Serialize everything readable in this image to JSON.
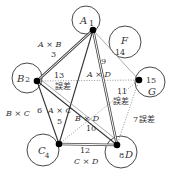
{
  "diagram": {
    "type": "factor-interaction-graph",
    "nodes": [
      {
        "id": "A",
        "letter": "A",
        "number": "1"
      },
      {
        "id": "B",
        "letter": "B",
        "number": "2"
      },
      {
        "id": "C",
        "letter": "C",
        "number": "4"
      },
      {
        "id": "D",
        "letter": "D",
        "number": "8"
      },
      {
        "id": "F",
        "letter": "F",
        "number": "14"
      },
      {
        "id": "G",
        "letter": "G",
        "number": "15"
      }
    ],
    "edges": [
      {
        "from": "A",
        "to": "B",
        "label": "A × B",
        "number": "3",
        "style": "double"
      },
      {
        "from": "B",
        "to": "C",
        "label": "B × C",
        "number": "6",
        "style": "solid"
      },
      {
        "from": "A",
        "to": "C",
        "label": "A × C",
        "number": "5",
        "style": "solid"
      },
      {
        "from": "A",
        "to": "D",
        "label": "A × D",
        "number": "9",
        "style": "double"
      },
      {
        "from": "B",
        "to": "D",
        "label": "B × D",
        "number": "10",
        "style": "solid"
      },
      {
        "from": "C",
        "to": "D",
        "label": "C × D",
        "number": "12",
        "style": "double"
      },
      {
        "from": "B",
        "to": "G",
        "label": "誤差",
        "number": "13",
        "style": "dotted"
      },
      {
        "from": "A",
        "to": "G",
        "label": "誤差",
        "number": "11",
        "style": "thin"
      },
      {
        "from": "G",
        "to": "D",
        "label": "誤差",
        "number": "7",
        "style": "dotted"
      }
    ],
    "labels": {
      "A_letter": "A",
      "A_num": "1",
      "B_letter": "B",
      "B_num": "2",
      "C_letter": "C",
      "C_num": "4",
      "D_letter": "D",
      "D_num": "8",
      "F_letter": "F",
      "F_num": "14",
      "G_letter": "G",
      "G_num": "15",
      "AxB": "A × B",
      "AxB_num": "3",
      "BxC": "B × C",
      "BxC_num": "6",
      "AxC": "A × C",
      "AxC_num": "5",
      "AxD": "A × D",
      "AxD_num": "9",
      "BxD": "B × D",
      "BxD_num": "10",
      "CxD": "C × D",
      "CxD_num": "12",
      "err13_num": "13",
      "err13": "誤差",
      "err11_num": "11",
      "err11": "誤差",
      "err7_num": "7",
      "err7": "誤差"
    }
  }
}
